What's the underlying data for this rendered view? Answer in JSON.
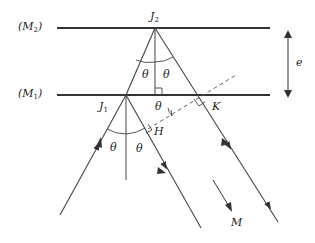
{
  "labels": {
    "mirror2": "(M",
    "mirror2_sub": "2",
    "mirror1": "(M",
    "mirror1_sub": "1",
    "close_paren": ")",
    "J2": "J",
    "J2_sub": "2",
    "J1": "J",
    "J1_sub": "1",
    "theta": "θ",
    "K": "K",
    "H": "H",
    "e": "e",
    "M": "M"
  },
  "colors": {
    "line": "#333333",
    "background": "#ffffff"
  }
}
